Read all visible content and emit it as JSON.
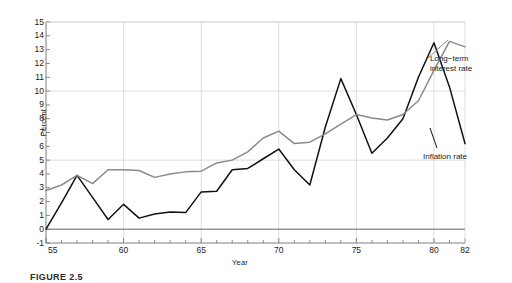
{
  "chart_data": {
    "type": "line",
    "title": "",
    "xlabel": "Year",
    "ylabel": "Percent",
    "xlim": [
      55,
      82
    ],
    "ylim": [
      -1,
      15
    ],
    "xticks": [
      55,
      60,
      65,
      70,
      75,
      80,
      82
    ],
    "xtick_labels": [
      "55",
      "60",
      "65",
      "70",
      "75",
      "80",
      "82"
    ],
    "yticks": [
      -1,
      0,
      1,
      2,
      3,
      4,
      5,
      6,
      7,
      8,
      9,
      10,
      11,
      12,
      13,
      14,
      15
    ],
    "ytick_labels": [
      "-1",
      "0",
      "1",
      "2",
      "3",
      "4",
      "5",
      "6",
      "7",
      "8",
      "9",
      "10",
      "11",
      "12",
      "13",
      "14",
      "15"
    ],
    "grid": true,
    "grid_x_values": [
      60,
      65,
      70,
      75,
      80
    ],
    "grid_y_values": [
      0,
      5,
      10,
      15
    ],
    "legend_position": "inline-annotations",
    "x": [
      55,
      56,
      57,
      58,
      59,
      60,
      61,
      62,
      63,
      64,
      65,
      66,
      67,
      68,
      69,
      70,
      71,
      72,
      73,
      74,
      75,
      76,
      77,
      78,
      79,
      80,
      81,
      82
    ],
    "series": [
      {
        "name": "Inflation rate",
        "color": "#111111",
        "values": [
          0.0,
          1.9,
          3.9,
          2.3,
          0.7,
          1.8,
          0.8,
          1.1,
          1.25,
          1.2,
          2.7,
          2.75,
          4.3,
          4.4,
          5.1,
          5.8,
          4.3,
          3.2,
          7.4,
          10.9,
          8.3,
          5.5,
          6.6,
          8.0,
          11.0,
          13.5,
          10.3,
          6.2
        ]
      },
      {
        "name": "Long-term interest rate",
        "color": "#8a8a8a",
        "values": [
          2.8,
          3.2,
          3.9,
          3.3,
          4.3,
          4.3,
          4.25,
          3.75,
          4.0,
          4.15,
          4.2,
          4.8,
          5.0,
          5.6,
          6.6,
          7.1,
          6.2,
          6.3,
          6.9,
          7.6,
          8.3,
          8.05,
          7.9,
          8.3,
          9.3,
          11.5,
          13.6,
          13.2
        ]
      }
    ],
    "annotations": [
      {
        "name": "long-term-interest-rate-label",
        "text": "Long−term\ninterest rate",
        "series": "Long-term interest rate"
      },
      {
        "name": "inflation-rate-label",
        "text": "Inflation rate",
        "series": "Inflation rate"
      }
    ]
  },
  "axes": {
    "y_title": "Percent",
    "x_title": "Year"
  },
  "caption": {
    "text": "FIGURE 2.5"
  },
  "colors": {
    "inflation": "#111111",
    "interest": "#8a8a8a",
    "grid": "#d5d5d5",
    "axis": "#6f6f6f",
    "background": "#ffffff"
  }
}
